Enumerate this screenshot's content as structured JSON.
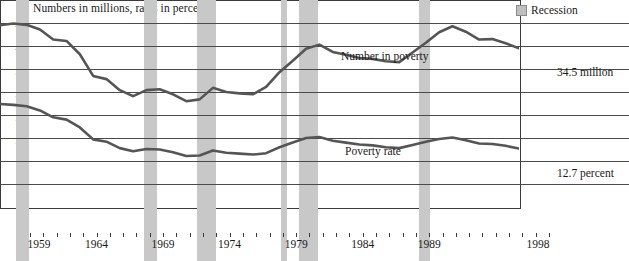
{
  "chart_title": "Numbers in millions, rates in percent",
  "legend": {
    "recession_label": "Recession",
    "recession_color": "#c8c8c8"
  },
  "annotations": {
    "number_series_label": "Number in poverty",
    "rate_series_label": "Poverty rate",
    "number_end_label": "34.5 million",
    "rate_end_label": "12.7 percent"
  },
  "chart_data": {
    "type": "line",
    "title": "Numbers in millions, rates in percent",
    "xlabel": "",
    "ylabel": "",
    "xlim": [
      1959,
      1998
    ],
    "ylim": [
      0,
      45
    ],
    "ytick_step": 5,
    "grid": true,
    "legend_position": "top-right",
    "line_color": "#555555",
    "x": [
      1959,
      1960,
      1961,
      1962,
      1963,
      1964,
      1965,
      1966,
      1967,
      1968,
      1969,
      1970,
      1971,
      1972,
      1973,
      1974,
      1975,
      1976,
      1977,
      1978,
      1979,
      1980,
      1981,
      1982,
      1983,
      1984,
      1985,
      1986,
      1987,
      1988,
      1989,
      1990,
      1991,
      1992,
      1993,
      1994,
      1995,
      1996,
      1997,
      1998
    ],
    "yticks": [
      0,
      5,
      10,
      15,
      20,
      25,
      30,
      35,
      40,
      45
    ],
    "xticks": [
      1959,
      1964,
      1969,
      1974,
      1979,
      1984,
      1989,
      1998
    ],
    "xtick_labels": [
      "1959",
      "1964",
      "1969",
      "1974",
      "1979",
      "1984",
      "1989",
      "1998"
    ],
    "series": [
      {
        "name": "Number in poverty",
        "unit": "millions",
        "end_value": 34.5,
        "values": [
          39.5,
          39.9,
          39.6,
          38.6,
          36.4,
          36.1,
          33.2,
          28.5,
          27.8,
          25.4,
          24.1,
          25.4,
          25.6,
          24.5,
          23.0,
          23.4,
          25.9,
          25.0,
          24.7,
          24.5,
          26.1,
          29.3,
          31.8,
          34.4,
          35.3,
          33.7,
          33.1,
          32.4,
          32.2,
          31.7,
          31.5,
          33.6,
          35.7,
          38.0,
          39.3,
          38.1,
          36.4,
          36.5,
          35.6,
          34.5
        ]
      },
      {
        "name": "Poverty rate",
        "unit": "percent",
        "end_value": 12.7,
        "values": [
          22.4,
          22.2,
          21.9,
          21.0,
          19.5,
          19.0,
          17.3,
          14.7,
          14.2,
          12.8,
          12.1,
          12.6,
          12.5,
          11.9,
          11.1,
          11.2,
          12.3,
          11.8,
          11.6,
          11.4,
          11.7,
          13.0,
          14.0,
          15.0,
          15.2,
          14.4,
          14.0,
          13.6,
          13.4,
          13.0,
          12.8,
          13.5,
          14.2,
          14.8,
          15.1,
          14.5,
          13.8,
          13.7,
          13.3,
          12.7
        ]
      }
    ],
    "recessions": [
      {
        "start": 1960.2,
        "end": 1961.2
      },
      {
        "start": 1969.8,
        "end": 1970.8
      },
      {
        "start": 1973.8,
        "end": 1975.2
      },
      {
        "start": 1980.1,
        "end": 1980.6
      },
      {
        "start": 1981.5,
        "end": 1982.9
      },
      {
        "start": 1990.5,
        "end": 1991.3
      }
    ]
  }
}
